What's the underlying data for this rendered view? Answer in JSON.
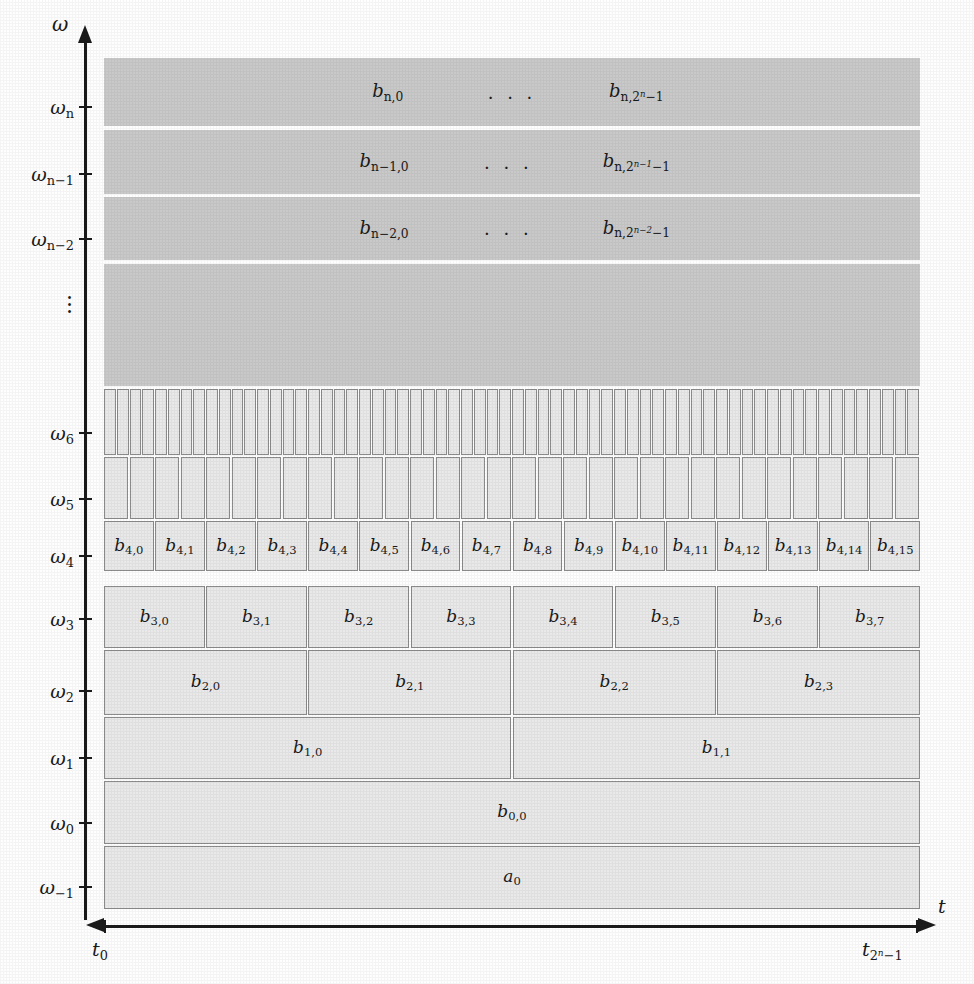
{
  "figure": {
    "type": "wavelet-packet-tiling-diagram",
    "y_axis_label": "ω",
    "x_axis_label": "t",
    "x_tick_labels": [
      "t₀",
      "t₂ⁿ⁻¹"
    ],
    "x_ticks": [
      {
        "label_base": "t",
        "label_sub": "0"
      },
      {
        "label_base": "t",
        "label_sub": "2",
        "label_sub_sup": "n",
        "label_sub_tail": "−1"
      }
    ],
    "vertical_ellipsis": "⋮",
    "colors": {
      "dark_band": "#c9c9c9",
      "cell_fill": "#e9e9e9",
      "cell_border": "#8c8c8c",
      "axis": "#1b1b1b",
      "page": "#fefefe"
    }
  },
  "y_axis": {
    "ticks": [
      {
        "id": "omega-n",
        "base": "ω",
        "sub": "n",
        "top": 96,
        "band": "dark-n"
      },
      {
        "id": "omega-n-1",
        "base": "ω",
        "sub": "n−1",
        "top": 163,
        "band": "dark-n-1"
      },
      {
        "id": "omega-n-2",
        "base": "ω",
        "sub": "n−2",
        "top": 228,
        "band": "dark-n-2"
      },
      {
        "id": "omega-6",
        "base": "ω",
        "sub": "6",
        "top": 422,
        "band": "row6"
      },
      {
        "id": "omega-5",
        "base": "ω",
        "sub": "5",
        "top": 488,
        "band": "row5"
      },
      {
        "id": "omega-4",
        "base": "ω",
        "sub": "4",
        "top": 545,
        "band": "row4"
      },
      {
        "id": "omega-3",
        "base": "ω",
        "sub": "3",
        "top": 608,
        "band": "row3"
      },
      {
        "id": "omega-2",
        "base": "ω",
        "sub": "2",
        "top": 680,
        "band": "row2"
      },
      {
        "id": "omega-1",
        "base": "ω",
        "sub": "1",
        "top": 747,
        "band": "row1"
      },
      {
        "id": "omega-0",
        "base": "ω",
        "sub": "0",
        "top": 812,
        "band": "row0"
      },
      {
        "id": "omega-minus-1",
        "base": "ω",
        "sub": "−1",
        "top": 876,
        "band": "rowa"
      }
    ]
  },
  "bands": {
    "dark_n": {
      "label_left": "b",
      "sub_left": "n,0",
      "ellipsis": ". . .",
      "label_right": "b",
      "sub_right_base": "n,2",
      "sub_right_sup": "n",
      "sub_right_tail": "−1",
      "top": 58,
      "height": 68
    },
    "dark_n1": {
      "label_left": "b",
      "sub_left": "n−1,0",
      "ellipsis": ". . .",
      "label_right": "b",
      "sub_right_base": "n,2",
      "sub_right_sup": "n−1",
      "sub_right_tail": "−1",
      "top": 130,
      "height": 64
    },
    "dark_n2": {
      "label_left": "b",
      "sub_left": "n−2,0",
      "ellipsis": ". . .",
      "label_right": "b",
      "sub_right_base": "n,2",
      "sub_right_sup": "n−2",
      "sub_right_tail": "−1",
      "top": 197,
      "height": 63
    },
    "dark_fill": {
      "top": 264,
      "height": 122
    }
  },
  "rows": {
    "row6": {
      "name": "omega-6-row",
      "count": 64,
      "labels": [],
      "top": 389,
      "height": 66
    },
    "row5": {
      "name": "omega-5-row",
      "count": 32,
      "labels": [],
      "top": 457,
      "height": 62
    },
    "row4": {
      "name": "omega-4-row",
      "count": 16,
      "top": 521,
      "height": 50,
      "labels": [
        "b4,0",
        "b4,1",
        "b4,2",
        "b4,3",
        "b4,4",
        "b4,5",
        "b4,6",
        "b4,7",
        "b4,8",
        "b4,9",
        "b4,10",
        "b4,11",
        "b4,12",
        "b4,13",
        "b4,14",
        "b4,15"
      ],
      "label_base": "b",
      "subs": [
        "4,0",
        "4,1",
        "4,2",
        "4,3",
        "4,4",
        "4,5",
        "4,6",
        "4,7",
        "4,8",
        "4,9",
        "4,10",
        "4,11",
        "4,12",
        "4,13",
        "4,14",
        "4,15"
      ]
    },
    "row3": {
      "name": "omega-3-row",
      "count": 8,
      "top": 586,
      "height": 62,
      "label_base": "b",
      "subs": [
        "3,0",
        "3,1",
        "3,2",
        "3,3",
        "3,4",
        "3,5",
        "3,6",
        "3,7"
      ]
    },
    "row2": {
      "name": "omega-2-row",
      "count": 4,
      "top": 650,
      "height": 65,
      "label_base": "b",
      "subs": [
        "2,0",
        "2,1",
        "2,2",
        "2,3"
      ]
    },
    "row1": {
      "name": "omega-1-row",
      "count": 2,
      "top": 717,
      "height": 62,
      "label_base": "b",
      "subs": [
        "1,0",
        "1,1"
      ]
    },
    "row0": {
      "name": "omega-0-row",
      "count": 1,
      "top": 781,
      "height": 63,
      "label_base": "b",
      "subs": [
        "0,0"
      ]
    },
    "rowa": {
      "name": "omega-minus-1-row",
      "count": 1,
      "top": 846,
      "height": 63,
      "label_base": "a",
      "subs": [
        "0"
      ]
    }
  }
}
